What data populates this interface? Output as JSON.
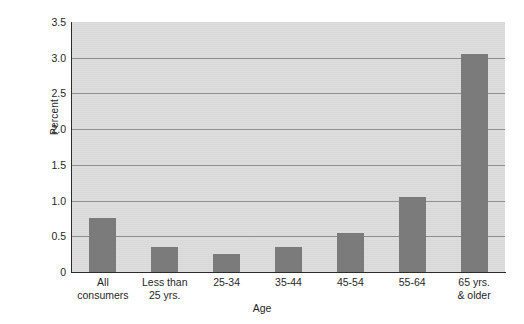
{
  "chart_data": {
    "type": "bar",
    "title": "",
    "xlabel": "Age",
    "ylabel": "Percent",
    "categories": [
      "All consumers",
      "Less than 25 yrs.",
      "25-34",
      "35-44",
      "45-54",
      "55-64",
      "65 yrs. & older"
    ],
    "category_lines": [
      [
        "All",
        "consumers"
      ],
      [
        "Less than",
        "25 yrs."
      ],
      [
        "25-34"
      ],
      [
        "35-44"
      ],
      [
        "45-54"
      ],
      [
        "55-64"
      ],
      [
        "65 yrs.",
        "& older"
      ]
    ],
    "values": [
      0.75,
      0.35,
      0.25,
      0.35,
      0.55,
      1.05,
      3.05
    ],
    "ylim": [
      0,
      3.5
    ],
    "ytick_values": [
      0,
      0.5,
      1.0,
      1.5,
      2.0,
      2.5,
      3.0,
      3.5
    ],
    "ytick_labels": [
      "0",
      "0.5",
      "1.0",
      "1.5",
      "2.0",
      "2.5",
      "3.0",
      "3.5"
    ],
    "grid": true,
    "legend": false,
    "legend_position": "none",
    "colors": {
      "bar": "#7b7b7b",
      "plot_background": "#dcdcdc",
      "gridline": "#8d8d8d",
      "axis": "#2b2b2b",
      "text": "#1f1f1f",
      "page_background": "#ffffff"
    }
  }
}
